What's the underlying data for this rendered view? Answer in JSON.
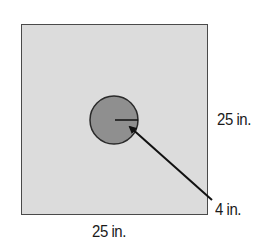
{
  "diagram": {
    "square": {
      "side_label": "25 in.",
      "bottom_label": "25 in.",
      "fill": "#dcdcdc",
      "stroke": "#4a4a4a"
    },
    "circle": {
      "radius_label": "4 in.",
      "fill": "#8f8f8f",
      "stroke": "#2a2a2a"
    },
    "labels": {
      "right": "25 in.",
      "bottom": "25 in.",
      "radius": "4 in."
    }
  }
}
